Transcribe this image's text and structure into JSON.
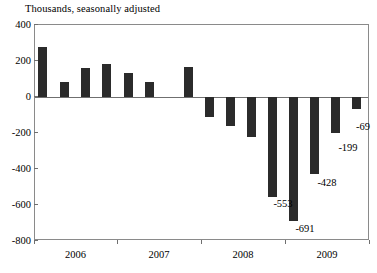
{
  "chart_data": {
    "type": "bar",
    "title": "",
    "subtitle": "Thousands, seasonally adjusted",
    "xlabel": "",
    "ylabel": "",
    "ylim": [
      -800,
      400
    ],
    "ytick_values": [
      400,
      200,
      0,
      -200,
      -400,
      -600,
      -800
    ],
    "ytick_labels": [
      "400",
      "200",
      "0",
      "-200",
      "-400",
      "-600",
      "-800"
    ],
    "grid": false,
    "legend": null,
    "bar_color": "#2b2b2b",
    "axis_color": "#8a8a8a",
    "x_axis_ticks": [
      "2006",
      "2007",
      "2008",
      "2009"
    ],
    "categories": [
      "2006-1",
      "2006-2",
      "2006-3",
      "2006-4",
      "2006-5",
      "2006-6",
      "2007-1",
      "2008-1",
      "2008-2",
      "2008-3",
      "2008-4",
      "2008-5",
      "2008-6",
      "2009-1",
      "2009-2"
    ],
    "values": [
      277,
      85,
      162,
      185,
      135,
      85,
      168,
      -110,
      -160,
      -220,
      -553,
      -691,
      -428,
      -199,
      -69
    ],
    "annotations": [
      {
        "label": "-553",
        "value": -553
      },
      {
        "label": "-691",
        "value": -691
      },
      {
        "label": "-428",
        "value": -428
      },
      {
        "label": "-199",
        "value": -199
      },
      {
        "label": "-69",
        "value": -69
      }
    ]
  },
  "axis": {
    "y_labels": [
      "400",
      "200",
      "0",
      "-200",
      "-400",
      "-600",
      "-800"
    ],
    "x_labels": [
      "2006",
      "2007",
      "2008",
      "2009"
    ]
  },
  "labels": {
    "subtitle": "Thousands, seasonally adjusted",
    "v553": "-553",
    "v691": "-691",
    "v428": "-428",
    "v199": "-199",
    "v69": "-69"
  }
}
